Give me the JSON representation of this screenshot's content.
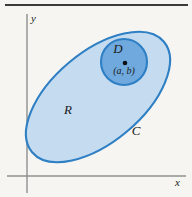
{
  "figure": {
    "type": "math-diagram",
    "background_color": "#f6f5f1",
    "top_rule_color": "#3a3a3a"
  },
  "axes": {
    "x_label": "x",
    "y_label": "y",
    "color": "#8c8c8c",
    "origin_x": 27,
    "origin_y": 176
  },
  "regions": {
    "outer": {
      "label": "R",
      "boundary_label": "C",
      "fill_color": "#c5dcf0",
      "stroke_color": "#2e7fc4",
      "rotation_deg": -40,
      "center": [
        98,
        97
      ],
      "radius_x": 86,
      "radius_y": 45
    },
    "inner": {
      "label": "D",
      "point_label": "(a, b)",
      "fill_color": "#6fa9dd",
      "stroke_color": "#2e7fc4",
      "center": [
        124,
        62
      ],
      "radius": 23,
      "point": [
        125,
        63
      ]
    }
  }
}
